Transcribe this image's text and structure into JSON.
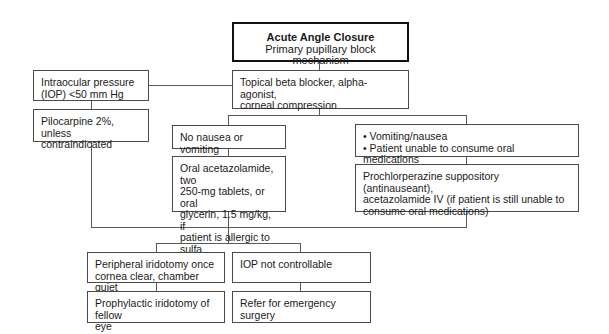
{
  "diagram": {
    "title": "Acute Angle Closure",
    "subtitle": "Primary pupillary block mechanism",
    "nodes": {
      "iop_low": "Intraocular pressure\n(IOP) <50 mm Hg",
      "pilocarpine": "Pilocarpine 2%, unless\ncontraindicated",
      "topical": "Topical beta blocker, alpha-agonist,\ncorneal compression",
      "no_nausea": "No nausea or vomiting",
      "oral_acetazolamide": "Oral acetazolamide, two\n250-mg tablets, or oral\nglycerin, 1.5 mg/kg, if\npatient is allergic to sulfa",
      "vomiting": "• Vomiting/nausea\n• Patient unable to consume oral medications",
      "prochlorperazine": "Prochlorperazine suppository (antinauseant),\nacetazolamide IV (if patient is still unable to\nconsume oral medications)",
      "peripheral_iridotomy": "Peripheral iridotomy once\ncornea clear, chamber quiet",
      "iop_not_controllable": "IOP not controllable",
      "prophylactic_iridotomy": "Prophylactic iridotomy of fellow\neye",
      "refer_surgery": "Refer for emergency surgery"
    }
  }
}
